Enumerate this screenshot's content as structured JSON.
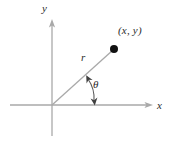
{
  "figure": {
    "width": 169,
    "height": 141,
    "background_color": "#ffffff",
    "axis_color": "#a9a9a9",
    "ray_color": "#a9a9a9",
    "arc_color": "#4a4a4a",
    "point_color": "#111111",
    "label_color": "#2b2b2b"
  },
  "labels": {
    "y_axis": "y",
    "x_axis": "x",
    "radius": "r",
    "angle": "θ",
    "point": "(x, y)"
  },
  "geometry": {
    "origin": {
      "x": 52,
      "y": 105
    },
    "point": {
      "x": 114,
      "y": 49
    },
    "y_axis": {
      "x": 52,
      "top": 20,
      "bottom": 136
    },
    "x_axis": {
      "y": 105,
      "left": 10,
      "right": 152
    },
    "angle_degrees": 42
  }
}
